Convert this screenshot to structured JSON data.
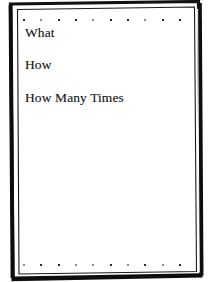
{
  "document": {
    "page_background": "#ffffff",
    "ink_color": "#1c1c1c",
    "frame_color": "#111111",
    "lines": [
      {
        "text": "What"
      },
      {
        "text": "How"
      },
      {
        "text": "How Many Times"
      }
    ],
    "decorations": {
      "top_dot_row": {
        "name": "top-dot-row",
        "count": 10,
        "dot_color": "#2b2b2b"
      },
      "bottom_dot_row": {
        "name": "bottom-dot-row",
        "count": 10,
        "dot_color": "#2b2b2b"
      }
    },
    "frame": {
      "style": "hand-drawn double rule",
      "outer_stroke": "thick",
      "inner_stroke": "thin"
    }
  }
}
